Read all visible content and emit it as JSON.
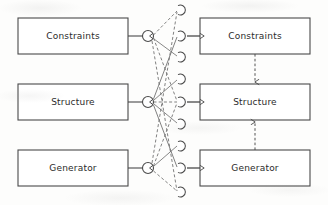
{
  "figure": {
    "title": "",
    "background_color": "#fdfdfc",
    "stroke_color": "#4a4a4a",
    "text_color": "#2b2b2b"
  },
  "left_column": {
    "name": "source-boxes",
    "boxes": [
      {
        "label": "Constraints",
        "x": 18,
        "y": 18,
        "w": 110,
        "h": 36
      },
      {
        "label": "Structure",
        "x": 18,
        "y": 84,
        "w": 110,
        "h": 36
      },
      {
        "label": "Generator",
        "x": 18,
        "y": 150,
        "w": 110,
        "h": 36
      }
    ]
  },
  "right_column": {
    "name": "target-boxes",
    "boxes": [
      {
        "label": "Constraints",
        "x": 200,
        "y": 18,
        "w": 110,
        "h": 36
      },
      {
        "label": "Structure",
        "x": 200,
        "y": 84,
        "w": 110,
        "h": 36
      },
      {
        "label": "Generator",
        "x": 200,
        "y": 150,
        "w": 110,
        "h": 36
      }
    ]
  },
  "source_ports": {
    "name": "circle-nodes",
    "shape": "circle",
    "radius": 5.5,
    "nodes": [
      {
        "cx": 148,
        "cy": 36
      },
      {
        "cx": 148,
        "cy": 102
      },
      {
        "cx": 148,
        "cy": 168
      }
    ]
  },
  "target_ports": {
    "name": "arc-nodes",
    "shape": "left-opening-arc",
    "radius": 5,
    "nodes": [
      {
        "cx": 182,
        "cy": 10
      },
      {
        "cx": 182,
        "cy": 36
      },
      {
        "cx": 182,
        "cy": 57
      },
      {
        "cx": 182,
        "cy": 79
      },
      {
        "cx": 182,
        "cy": 102
      },
      {
        "cx": 182,
        "cy": 124
      },
      {
        "cx": 182,
        "cy": 146
      },
      {
        "cx": 182,
        "cy": 168
      },
      {
        "cx": 182,
        "cy": 192
      }
    ]
  },
  "connections": {
    "box_to_circle": [
      {
        "from": "left-constraints",
        "to": "circle-1",
        "style": "solid"
      },
      {
        "from": "left-structure",
        "to": "circle-2",
        "style": "solid"
      },
      {
        "from": "left-generator",
        "to": "circle-3",
        "style": "solid"
      }
    ],
    "arc_to_box": [
      {
        "from": "arc-2",
        "to": "right-constraints",
        "style": "solid"
      },
      {
        "from": "arc-5",
        "to": "right-structure",
        "style": "solid"
      },
      {
        "from": "arc-8",
        "to": "right-generator",
        "style": "solid"
      }
    ],
    "crossing": [
      {
        "from": "circle-1",
        "to": "arc-1",
        "style": "dashed"
      },
      {
        "from": "circle-1",
        "to": "arc-5",
        "style": "dashed"
      },
      {
        "from": "circle-1",
        "to": "arc-9",
        "style": "dashed"
      },
      {
        "from": "circle-2",
        "to": "arc-2",
        "style": "solid"
      },
      {
        "from": "circle-2",
        "to": "arc-5",
        "style": "dashed"
      },
      {
        "from": "circle-2",
        "to": "arc-8",
        "style": "solid"
      },
      {
        "from": "circle-3",
        "to": "arc-1",
        "style": "dashed"
      },
      {
        "from": "circle-3",
        "to": "arc-5",
        "style": "dashed"
      },
      {
        "from": "circle-3",
        "to": "arc-9",
        "style": "dashed"
      }
    ],
    "vertical_dashed": [
      {
        "from": "right-constraints",
        "to": "right-structure",
        "style": "dashed",
        "arrow": "down"
      },
      {
        "from": "right-generator",
        "to": "right-structure",
        "style": "dashed",
        "arrow": "up"
      }
    ]
  }
}
